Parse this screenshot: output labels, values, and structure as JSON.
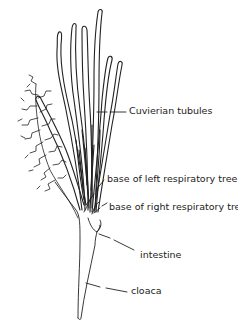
{
  "diagram": {
    "labels": [
      {
        "id": "cuvierian",
        "text": "Cuvierian tubules",
        "x": 129,
        "y": 107
      },
      {
        "id": "left-tree",
        "text": "base of left respiratory tree",
        "x": 107,
        "y": 175
      },
      {
        "id": "right-tree",
        "text": "base of right respiratory tree",
        "x": 109,
        "y": 203
      },
      {
        "id": "intestine",
        "text": "intestine",
        "x": 140,
        "y": 251
      },
      {
        "id": "cloaca",
        "text": "cloaca",
        "x": 131,
        "y": 286
      }
    ],
    "colors": {
      "ink": "#222222",
      "background": "#ffffff"
    }
  }
}
